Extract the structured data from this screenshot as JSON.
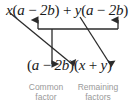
{
  "figure": {
    "background_color": "#ffffff",
    "text_color": "#1a1a1a",
    "caption_color": "#9a9a9a",
    "arrow_color": "#2b2b2b"
  },
  "top_expression": {
    "full_text": "x(a − 2b) + y(a − 2b)",
    "parts": {
      "x": "x",
      "open1": "(",
      "a1": "a",
      "minus1": " − ",
      "two_b1": "2b",
      "close1": ")",
      "plus": " + ",
      "y": "y",
      "open2": "(",
      "a2": "a",
      "minus2": " − ",
      "two_b2": "2b",
      "close2": ")"
    }
  },
  "bottom_expression": {
    "full_text": "(a − 2b)(x + y)",
    "parts": {
      "open1": "(",
      "a": "a",
      "minus": " − ",
      "two_b": "2b",
      "close1": ")",
      "open2": "(",
      "x": "x",
      "plus": " + ",
      "y": "y",
      "close2": ")"
    }
  },
  "captions": {
    "common_factor": {
      "line1": "Common",
      "line2": "factor"
    },
    "remaining_factors": {
      "line1": "Remaining",
      "line2": "factors"
    }
  },
  "annotations": {
    "bracket_label": "bracket joining both (a − 2b) binomials",
    "down_arrow_label": "common factor moves down",
    "diagonal_x_label": "x moves to remaining factors",
    "diagonal_y_label": "y moves to remaining factors"
  }
}
